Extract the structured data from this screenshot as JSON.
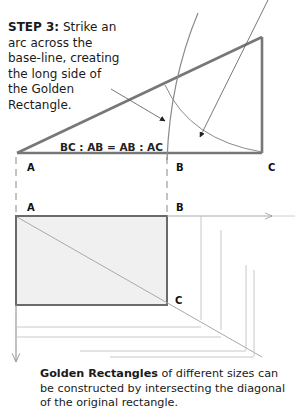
{
  "step": {
    "heading": "STEP 3:",
    "body": "Strike an arc across the base-line, creating the long side of the Golden Rectangle."
  },
  "ratio_label": "BC : AB = AB : AC",
  "upper_labels": {
    "a": "A",
    "b": "B",
    "c": "C"
  },
  "lower_labels": {
    "a": "A",
    "b": "B",
    "c": "C"
  },
  "caption": {
    "bold": "Golden Rectangles",
    "rest": " of different sizes can be constructed by intersecting the diagonal of the original rectangle."
  },
  "colors": {
    "ink": "#1a1a1a",
    "stroke": "#6e6e6e",
    "light_stroke": "#b5b5b5",
    "fill": "#efefef"
  }
}
